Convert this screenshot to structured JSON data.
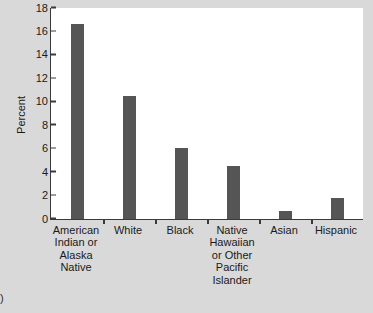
{
  "figure": {
    "background_color": "#d9d9d9",
    "plot_background_color": "#ffffff",
    "axis_color": "#3a3a3a",
    "bar_color": "#555555",
    "caption_fragment": ")"
  },
  "chart_data": {
    "type": "bar",
    "title": "",
    "xlabel": "",
    "ylabel": "Percent",
    "ylim": [
      0,
      18
    ],
    "ytick_labels": [
      "0",
      "2",
      "4",
      "6",
      "8",
      "10",
      "12",
      "14",
      "16",
      "18"
    ],
    "ytick_values": [
      0,
      2,
      4,
      6,
      8,
      10,
      12,
      14,
      16,
      18
    ],
    "grid": false,
    "legend": false,
    "categories": [
      "American\nIndian or\nAlaska\nNative",
      "White",
      "Black",
      "Native\nHawaiian\nor Other\nPacific\nIslander",
      "Asian",
      "Hispanic"
    ],
    "values": [
      16.6,
      10.5,
      6.05,
      4.5,
      0.7,
      1.8
    ]
  }
}
